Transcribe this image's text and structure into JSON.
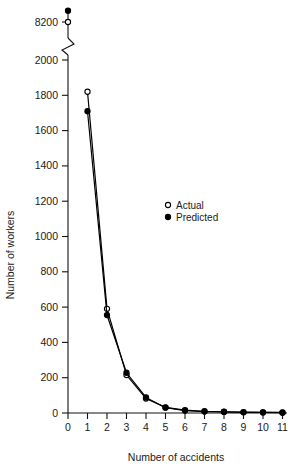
{
  "chart_data": {
    "type": "line",
    "title": "",
    "xlabel": "Number of accidents",
    "ylabel": "Number of workers",
    "x": [
      0,
      1,
      2,
      3,
      4,
      5,
      6,
      7,
      8,
      9,
      10,
      11
    ],
    "series": [
      {
        "name": "Actual",
        "marker": "open-circle",
        "values": [
          8200,
          1820,
          590,
          215,
          82,
          32,
          16,
          10,
          7,
          5,
          4,
          3
        ]
      },
      {
        "name": "Predicted",
        "marker": "filled-circle",
        "values": [
          8350,
          1710,
          555,
          228,
          88,
          30,
          14,
          8,
          6,
          4,
          3,
          2
        ]
      }
    ],
    "xlim": [
      0,
      11
    ],
    "xticks": [
      0,
      1,
      2,
      3,
      4,
      5,
      6,
      7,
      8,
      9,
      10,
      11
    ],
    "xtick_labels": [
      "0",
      "1",
      "2",
      "3",
      "4",
      "5",
      "6",
      "7",
      "8",
      "9",
      "10",
      "11"
    ],
    "ylim": [
      0,
      2000
    ],
    "yticks": [
      0,
      200,
      400,
      600,
      800,
      1000,
      1200,
      1400,
      1600,
      1800,
      2000
    ],
    "ytick_labels": [
      "0",
      "200",
      "400",
      "600",
      "800",
      "1000",
      "1200",
      "1400",
      "1600",
      "1800",
      "2000"
    ],
    "axis_break": {
      "present": true,
      "below": 2000,
      "above_tick_value": 8200,
      "above_tick_label": "8200"
    },
    "grid": false,
    "legend_position": "center",
    "legend": [
      {
        "label": "Actual",
        "marker": "open-circle"
      },
      {
        "label": "Predicted",
        "marker": "filled-circle"
      }
    ]
  },
  "axes": {
    "x_title": "Number of accidents",
    "y_title": "Number of workers"
  },
  "ticks": {
    "y": {
      "t8200": "8200",
      "t2000": "2000",
      "t1800": "1800",
      "t1600": "1600",
      "t1400": "1400",
      "t1200": "1200",
      "t1000": "1000",
      "t800": "800",
      "t600": "600",
      "t400": "400",
      "t200": "200",
      "t0": "0"
    },
    "x": {
      "t0": "0",
      "t1": "1",
      "t2": "2",
      "t3": "3",
      "t4": "4",
      "t5": "5",
      "t6": "6",
      "t7": "7",
      "t8": "8",
      "t9": "9",
      "t10": "10",
      "t11": "11"
    }
  },
  "legend": {
    "actual_label": "Actual",
    "predicted_label": "Predicted"
  },
  "colors": {
    "axis": "#111111",
    "line": "#000000",
    "marker_fill_open": "#ffffff",
    "marker_fill_closed": "#000000",
    "background": "#ffffff"
  }
}
